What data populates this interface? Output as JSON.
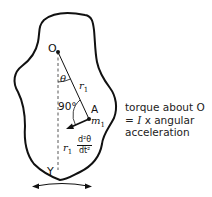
{
  "diagram": {
    "type": "rigid-body-pendulum",
    "labels": {
      "pivot": "O",
      "angle": "θ",
      "radius": "r",
      "radius_sub": "1",
      "right_angle": "90°",
      "point": "A",
      "mass": "m",
      "mass_sub": "1",
      "bottom": "Y",
      "accel_prefix": "r",
      "accel_prefix_sub": "1",
      "accel_num": "d²θ",
      "accel_den": "dt²"
    },
    "caption": {
      "line1": "torque about O",
      "line2_eq": "= ",
      "line2_I": "I",
      "line2_rest": " x angular",
      "line3": "acceleration"
    },
    "colors": {
      "stroke": "#111111",
      "background": "#ffffff"
    }
  }
}
